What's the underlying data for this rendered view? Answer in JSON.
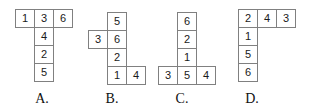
{
  "figure": {
    "type": "dice-net-multiple-choice",
    "grid": {
      "cell_width": 20,
      "cell_height": 19
    },
    "colors": {
      "background": "#ffffff",
      "cell_fill": "#ffffff",
      "cell_border": "#808080",
      "digit_text": "#1a1a1a",
      "label_text": "#111111"
    }
  },
  "options": [
    {
      "id": "A",
      "label": "A.",
      "label_x": 27,
      "label_y": 91,
      "origin_x": 15,
      "origin_y": 9,
      "cells": [
        {
          "name": "cell-a-1",
          "value": "1",
          "col": 0,
          "row": 0
        },
        {
          "name": "cell-a-3",
          "value": "3",
          "col": 1,
          "row": 0
        },
        {
          "name": "cell-a-6",
          "value": "6",
          "col": 2,
          "row": 0
        },
        {
          "name": "cell-a-4",
          "value": "4",
          "col": 1,
          "row": 1
        },
        {
          "name": "cell-a-2",
          "value": "2",
          "col": 1,
          "row": 2
        },
        {
          "name": "cell-a-5",
          "value": "5",
          "col": 1,
          "row": 3
        }
      ]
    },
    {
      "id": "B",
      "label": "B.",
      "label_x": 97,
      "label_y": 91,
      "origin_x": 88,
      "origin_y": 12,
      "cells": [
        {
          "name": "cell-b-5",
          "value": "5",
          "col": 1,
          "row": 0
        },
        {
          "name": "cell-b-3",
          "value": "3",
          "col": 0,
          "row": 1
        },
        {
          "name": "cell-b-6",
          "value": "6",
          "col": 1,
          "row": 1
        },
        {
          "name": "cell-b-2",
          "value": "2",
          "col": 1,
          "row": 2
        },
        {
          "name": "cell-b-1",
          "value": "1",
          "col": 1,
          "row": 3
        },
        {
          "name": "cell-b-4",
          "value": "4",
          "col": 2,
          "row": 3
        }
      ]
    },
    {
      "id": "C",
      "label": "C.",
      "label_x": 167,
      "label_y": 91,
      "origin_x": 158,
      "origin_y": 12,
      "cells": [
        {
          "name": "cell-c-6",
          "value": "6",
          "col": 1,
          "row": 0
        },
        {
          "name": "cell-c-2",
          "value": "2",
          "col": 1,
          "row": 1
        },
        {
          "name": "cell-c-1",
          "value": "1",
          "col": 1,
          "row": 2
        },
        {
          "name": "cell-c-3",
          "value": "3",
          "col": 0,
          "row": 3
        },
        {
          "name": "cell-c-5",
          "value": "5",
          "col": 1,
          "row": 3
        },
        {
          "name": "cell-c-4",
          "value": "4",
          "col": 2,
          "row": 3
        }
      ]
    },
    {
      "id": "D",
      "label": "D.",
      "label_x": 237,
      "label_y": 91,
      "origin_x": 238,
      "origin_y": 9,
      "cells": [
        {
          "name": "cell-d-2",
          "value": "2",
          "col": 0,
          "row": 0
        },
        {
          "name": "cell-d-4",
          "value": "4",
          "col": 1,
          "row": 0
        },
        {
          "name": "cell-d-3",
          "value": "3",
          "col": 2,
          "row": 0
        },
        {
          "name": "cell-d-1",
          "value": "1",
          "col": 0,
          "row": 1
        },
        {
          "name": "cell-d-5",
          "value": "5",
          "col": 0,
          "row": 2
        },
        {
          "name": "cell-d-6",
          "value": "6",
          "col": 0,
          "row": 3
        }
      ]
    }
  ]
}
